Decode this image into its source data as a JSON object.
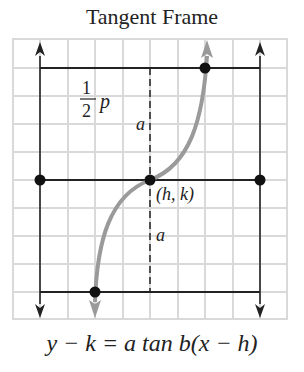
{
  "title": "Tangent Frame",
  "formula": "y − k = a tan b(x − h)",
  "labels": {
    "half_period_num": "1",
    "half_period_den": "2",
    "half_period_var": "p",
    "amplitude_top": "a",
    "amplitude_bottom": "a",
    "center_point": "(h, k)"
  },
  "colors": {
    "grid": "#d9d9d9",
    "frame": "#222222",
    "curve": "#9a9a9a",
    "point": "#111111"
  },
  "points": [
    {
      "name": "center",
      "x": 150,
      "y": 180
    },
    {
      "name": "left-mid",
      "x": 40,
      "y": 180
    },
    {
      "name": "right-mid",
      "x": 260,
      "y": 180
    },
    {
      "name": "top",
      "x": 205,
      "y": 68
    },
    {
      "name": "bottom",
      "x": 95,
      "y": 292
    }
  ]
}
